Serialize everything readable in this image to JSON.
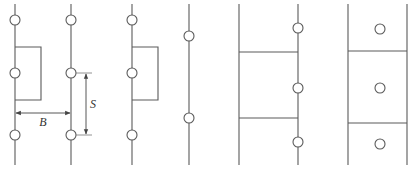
{
  "figure": {
    "panels": [
      {
        "id": "panel-1",
        "lines": [
          {
            "x": 15
          },
          {
            "x": 71
          }
        ],
        "circles": [
          {
            "x": 15,
            "y": 20
          },
          {
            "x": 15,
            "y": 73
          },
          {
            "x": 15,
            "y": 135
          },
          {
            "x": 71,
            "y": 20
          },
          {
            "x": 71,
            "y": 73
          },
          {
            "x": 71,
            "y": 135
          }
        ],
        "rect": {
          "x": 15,
          "y": 47,
          "w": 26,
          "h": 53
        },
        "dimensions": {
          "B": {
            "label": "B",
            "y": 113,
            "x1": 15,
            "x2": 71,
            "label_x": 43,
            "label_y": 126
          },
          "S": {
            "label": "S",
            "x": 86,
            "y1": 73,
            "y2": 135,
            "label_x": 93,
            "label_y": 108
          }
        }
      },
      {
        "id": "panel-2",
        "lines": [
          {
            "x": 132
          }
        ],
        "circles": [
          {
            "x": 132,
            "y": 20
          },
          {
            "x": 132,
            "y": 73
          },
          {
            "x": 132,
            "y": 135
          }
        ],
        "rect": {
          "x": 132,
          "y": 47,
          "w": 26,
          "h": 53
        }
      },
      {
        "id": "panel-3",
        "lines": [
          {
            "x": 189
          }
        ],
        "circles": [
          {
            "x": 189,
            "y": 36
          },
          {
            "x": 189,
            "y": 118
          }
        ]
      },
      {
        "id": "panel-4",
        "lines": [
          {
            "x": 239
          },
          {
            "x": 298
          }
        ],
        "horizontals": [
          {
            "y": 52
          },
          {
            "y": 118
          }
        ],
        "circles": [
          {
            "x": 298,
            "y": 28
          },
          {
            "x": 298,
            "y": 88
          },
          {
            "x": 298,
            "y": 142
          }
        ]
      },
      {
        "id": "panel-5",
        "lines": [
          {
            "x": 348
          },
          {
            "x": 407
          }
        ],
        "horizontals": [
          {
            "y": 51
          },
          {
            "y": 123
          }
        ],
        "circles": [
          {
            "x": 380,
            "y": 29
          },
          {
            "x": 380,
            "y": 88
          },
          {
            "x": 380,
            "y": 144
          }
        ]
      }
    ],
    "line_top": 4,
    "line_bottom": 165,
    "circle_r": 5,
    "stroke_color": "#5a5a5a"
  }
}
